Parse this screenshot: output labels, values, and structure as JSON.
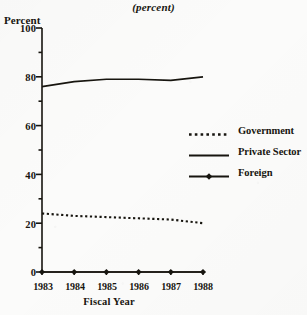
{
  "subtitle": "(percent)",
  "axes": {
    "y_title": "Percent",
    "x_title": "Fiscal Year",
    "y_ticks": [
      "0",
      "20",
      "40",
      "60",
      "80",
      "100"
    ],
    "x_ticks": [
      "1983",
      "1984",
      "1985",
      "1986",
      "1987",
      "1988"
    ]
  },
  "legend": {
    "items": [
      {
        "label": "Government",
        "style": "dotted",
        "marker": "none"
      },
      {
        "label": "Private Sector",
        "style": "solid",
        "marker": "none"
      },
      {
        "label": "Foreign",
        "style": "solid",
        "marker": "diamond"
      }
    ]
  },
  "colors": {
    "ink": "#17150f",
    "background": "#fbfbfa"
  },
  "chart_data": {
    "type": "line",
    "title": "",
    "subtitle": "(percent)",
    "xlabel": "Fiscal Year",
    "ylabel": "Percent",
    "x": [
      "1983",
      "1984",
      "1985",
      "1986",
      "1987",
      "1988"
    ],
    "ylim": [
      0,
      100
    ],
    "xlim": [
      "1983",
      "1988"
    ],
    "yticks": [
      0,
      20,
      40,
      60,
      80,
      100
    ],
    "grid": false,
    "legend_position": "right-middle",
    "series": [
      {
        "name": "Government",
        "style": "dotted",
        "marker": "none",
        "values": [
          24,
          23,
          22.5,
          22,
          21.5,
          20
        ]
      },
      {
        "name": "Private Sector",
        "style": "solid",
        "marker": "none",
        "values": [
          76,
          78,
          79,
          79,
          78.5,
          80
        ]
      },
      {
        "name": "Foreign",
        "style": "solid",
        "marker": "diamond",
        "values": [
          0,
          0,
          0,
          0,
          0,
          0
        ]
      }
    ]
  }
}
